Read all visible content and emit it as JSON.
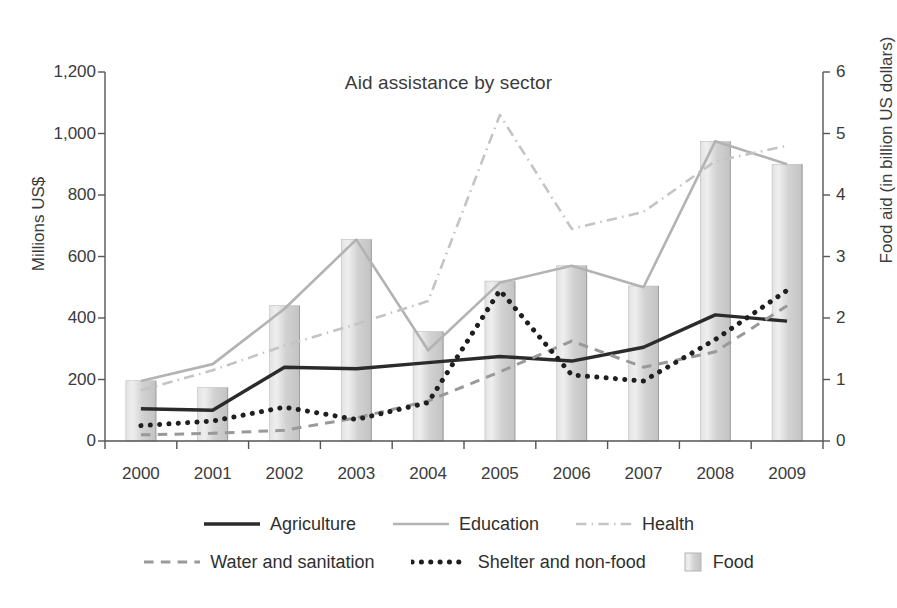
{
  "chart_data": {
    "type": "line",
    "title": "Aid assistance by sector",
    "xlabel": "",
    "ylabel": "Millions US$",
    "ylabel_right": "Food aid (in billion US dollars)",
    "categories": [
      "2000",
      "2001",
      "2002",
      "2003",
      "2004",
      "2005",
      "2006",
      "2007",
      "2008",
      "2009"
    ],
    "x": [
      2000,
      2001,
      2002,
      2003,
      2004,
      2005,
      2006,
      2007,
      2008,
      2009
    ],
    "ylim": [
      0,
      1200
    ],
    "ylim_right": [
      0,
      6
    ],
    "yticks": [
      "0",
      "200",
      "400",
      "600",
      "800",
      "1,000",
      "1,200"
    ],
    "ytick_values": [
      0,
      200,
      400,
      600,
      800,
      1000,
      1200
    ],
    "yticks_right": [
      "0",
      "1",
      "2",
      "3",
      "4",
      "5",
      "6"
    ],
    "ytick_values_right": [
      0,
      1,
      2,
      3,
      4,
      5,
      6
    ],
    "grid": false,
    "legend_position": "bottom",
    "series": [
      {
        "name": "Agriculture",
        "axis": "left",
        "style": "solid",
        "color": "#2b2b2b",
        "width": 3.4,
        "values": [
          105,
          100,
          240,
          235,
          255,
          275,
          260,
          305,
          410,
          390
        ]
      },
      {
        "name": "Education",
        "axis": "left",
        "style": "solid",
        "color": "#b3b3b3",
        "width": 2.6,
        "values": [
          195,
          250,
          430,
          655,
          295,
          515,
          570,
          500,
          975,
          900
        ]
      },
      {
        "name": "Health",
        "axis": "left",
        "style": "dashdot",
        "color": "#c4c4c4",
        "width": 2.6,
        "values": [
          165,
          230,
          310,
          380,
          455,
          1060,
          690,
          745,
          910,
          960
        ]
      },
      {
        "name": "Water and sanitation",
        "axis": "left",
        "style": "dashed",
        "color": "#999999",
        "width": 3.0,
        "values": [
          20,
          25,
          35,
          75,
          130,
          225,
          325,
          240,
          290,
          440
        ]
      },
      {
        "name": "Shelter and non-food",
        "axis": "left",
        "style": "dotted",
        "color": "#1f1f1f",
        "width": 5.0,
        "values": [
          50,
          65,
          110,
          70,
          125,
          490,
          215,
          195,
          330,
          490
        ]
      },
      {
        "name": "Food",
        "axis": "right",
        "style": "bar",
        "color": "#cccccc",
        "values": [
          0.98,
          0.87,
          2.2,
          3.28,
          1.78,
          2.6,
          2.85,
          2.52,
          4.87,
          4.5
        ]
      }
    ]
  },
  "legend": {
    "rows": [
      [
        {
          "label": "Agriculture",
          "swatch": "solid-dark-line-swatch"
        },
        {
          "label": "Education",
          "swatch": "solid-gray-line-swatch"
        },
        {
          "label": "Health",
          "swatch": "dashdot-line-swatch"
        }
      ],
      [
        {
          "label": "Water and sanitation",
          "swatch": "dashed-line-swatch"
        },
        {
          "label": "Shelter and non-food",
          "swatch": "dotted-line-swatch"
        },
        {
          "label": "Food",
          "swatch": "bar-swatch"
        }
      ]
    ]
  }
}
